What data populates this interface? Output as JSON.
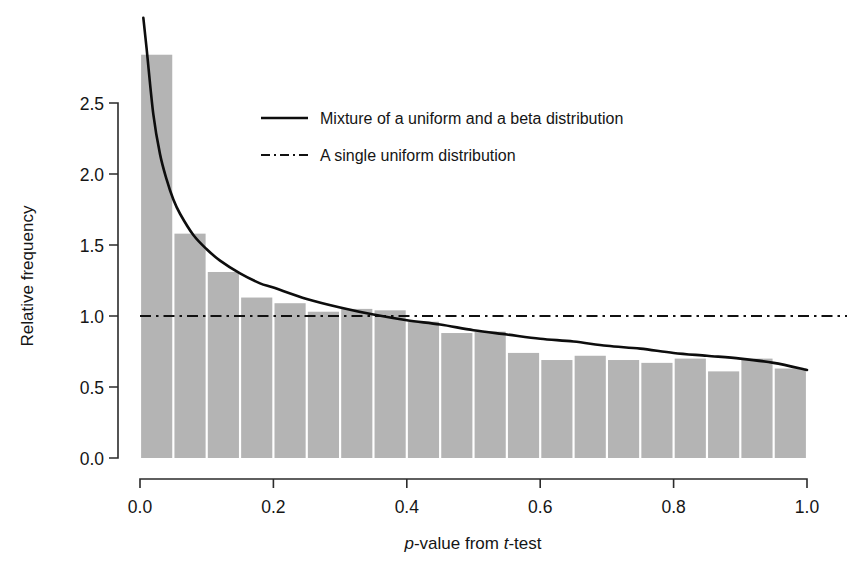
{
  "chart_data": {
    "type": "bar",
    "title": "",
    "subtitle": "",
    "xlabel_parts": [
      {
        "text": "p",
        "italic": true
      },
      {
        "text": "-value from ",
        "italic": false
      },
      {
        "text": "t",
        "italic": true
      },
      {
        "text": "-test",
        "italic": false
      }
    ],
    "xlabel": "p-value from t-test",
    "ylabel": "Relative frequency",
    "xlim": [
      0.0,
      1.0
    ],
    "ylim": [
      0.0,
      2.9
    ],
    "xticks": [
      0.0,
      0.2,
      0.4,
      0.6,
      0.8,
      1.0
    ],
    "xtick_labels": [
      "0.0",
      "0.2",
      "0.4",
      "0.6",
      "0.8",
      "1.0"
    ],
    "yticks": [
      0.0,
      0.5,
      1.0,
      1.5,
      2.0,
      2.5
    ],
    "ytick_labels": [
      "0.0",
      "0.5",
      "1.0",
      "1.5",
      "2.0",
      "2.5"
    ],
    "grid": false,
    "bin_width": 0.05,
    "bin_starts": [
      0.0,
      0.05,
      0.1,
      0.15,
      0.2,
      0.25,
      0.3,
      0.35,
      0.4,
      0.45,
      0.5,
      0.55,
      0.6,
      0.65,
      0.7,
      0.75,
      0.8,
      0.85,
      0.9,
      0.95
    ],
    "categories": [
      "0.00-0.05",
      "0.05-0.10",
      "0.10-0.15",
      "0.15-0.20",
      "0.20-0.25",
      "0.25-0.30",
      "0.30-0.35",
      "0.35-0.40",
      "0.40-0.45",
      "0.45-0.50",
      "0.50-0.55",
      "0.55-0.60",
      "0.60-0.65",
      "0.65-0.70",
      "0.70-0.75",
      "0.75-0.80",
      "0.80-0.85",
      "0.85-0.90",
      "0.90-0.95",
      "0.95-1.00"
    ],
    "values": [
      2.84,
      1.58,
      1.31,
      1.13,
      1.09,
      1.03,
      1.05,
      1.04,
      0.96,
      0.88,
      0.89,
      0.74,
      0.69,
      0.72,
      0.69,
      0.67,
      0.7,
      0.61,
      0.7,
      0.63
    ],
    "bar_color": "#b4b4b4",
    "series": [
      {
        "name": "Mixture of a uniform and a beta distribution",
        "style": "solid",
        "color": "#0d0d0d",
        "x": [
          0.005,
          0.01,
          0.02,
          0.03,
          0.04,
          0.05,
          0.06,
          0.08,
          0.1,
          0.12,
          0.15,
          0.18,
          0.2,
          0.25,
          0.3,
          0.35,
          0.4,
          0.45,
          0.5,
          0.55,
          0.6,
          0.65,
          0.7,
          0.75,
          0.8,
          0.85,
          0.9,
          0.95,
          1.0
        ],
        "y": [
          3.1,
          2.88,
          2.42,
          2.14,
          1.96,
          1.82,
          1.72,
          1.57,
          1.47,
          1.39,
          1.3,
          1.23,
          1.2,
          1.12,
          1.06,
          1.01,
          0.97,
          0.94,
          0.9,
          0.87,
          0.84,
          0.82,
          0.79,
          0.77,
          0.74,
          0.72,
          0.7,
          0.67,
          0.62
        ]
      },
      {
        "name": "A single uniform distribution",
        "style": "dashdot",
        "color": "#111111",
        "constant_y": 1.0
      }
    ],
    "legend": {
      "position": "top-center",
      "entries": [
        {
          "label": "Mixture of a uniform and a beta distribution",
          "style": "solid"
        },
        {
          "label": "A single uniform distribution",
          "style": "dashdot"
        }
      ]
    }
  }
}
